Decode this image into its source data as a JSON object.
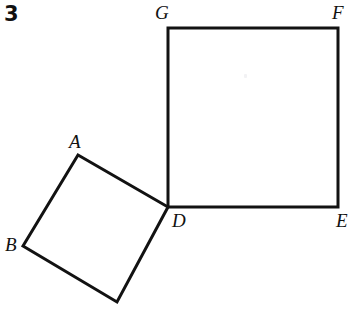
{
  "figure": {
    "problem_number": "3",
    "background_color": "#ffffff",
    "stroke_color": "#121212",
    "stroke_width": 3,
    "canvas": {
      "width": 352,
      "height": 309
    },
    "big_square": {
      "name": "square-DEFG",
      "vertices": [
        {
          "label": "G",
          "x": 168,
          "y": 28
        },
        {
          "label": "F",
          "x": 338,
          "y": 28
        },
        {
          "label": "E",
          "x": 338,
          "y": 207
        },
        {
          "label": "D",
          "x": 168,
          "y": 207
        }
      ],
      "path": "M 168 28 L 338 28 L 338 207 L 168 207 Z"
    },
    "small_square": {
      "name": "tilted-square-ABD",
      "vertices": [
        {
          "label": "A",
          "x": 78,
          "y": 155
        },
        {
          "label": "D",
          "x": 168,
          "y": 207
        },
        {
          "label": "",
          "x": 117,
          "y": 302
        },
        {
          "label": "B",
          "x": 23,
          "y": 246
        }
      ],
      "path": "M 78 155 L 168 207 L 117 302 L 23 246 Z"
    },
    "labels": [
      {
        "id": "label-G",
        "text": "G",
        "x": 155,
        "y": 3
      },
      {
        "id": "label-F",
        "text": "F",
        "x": 332,
        "y": 3
      },
      {
        "id": "label-A",
        "text": "A",
        "x": 69,
        "y": 132
      },
      {
        "id": "label-D",
        "text": "D",
        "x": 172,
        "y": 211
      },
      {
        "id": "label-E",
        "text": "E",
        "x": 336,
        "y": 211
      },
      {
        "id": "label-B",
        "text": "B",
        "x": 5,
        "y": 235
      }
    ]
  }
}
